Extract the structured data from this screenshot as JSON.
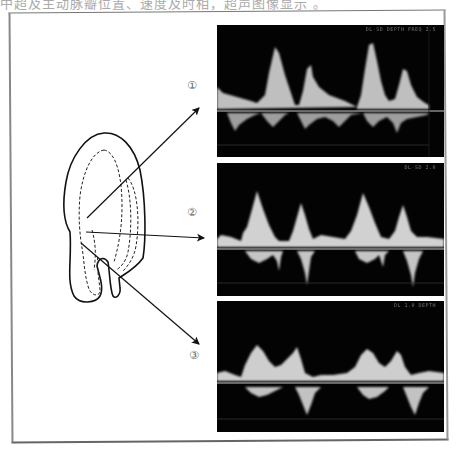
{
  "caption": "中超及主动脉瓣位置、速度及时相，超声图像显示 。",
  "diagram": {
    "labels": [
      {
        "id": "1",
        "text": "①"
      },
      {
        "id": "2",
        "text": "②"
      },
      {
        "id": "3",
        "text": "③"
      }
    ]
  },
  "panels": [
    {
      "id": "1",
      "header": "DL-SD  DEPTH  FREQ 2.5",
      "peaks": "E/A pattern, tall early peak, smaller late peak",
      "color_fg": "#e8e8e8"
    },
    {
      "id": "2",
      "header": "DL-SD  2.0",
      "peaks": "E/A pattern, sharp peaks above baseline, spiky below",
      "color_fg": "#e8e8e8"
    },
    {
      "id": "3",
      "header": "DL  1.0  DEPTH",
      "peaks": "Broad early peak, narrow late peak, flow below baseline",
      "color_fg": "#e8e8e8"
    }
  ],
  "colors": {
    "background": "#ffffff",
    "panel_bg": "#030303",
    "signal": "#e8e8e8",
    "line": "#111111",
    "label": "#666666"
  }
}
